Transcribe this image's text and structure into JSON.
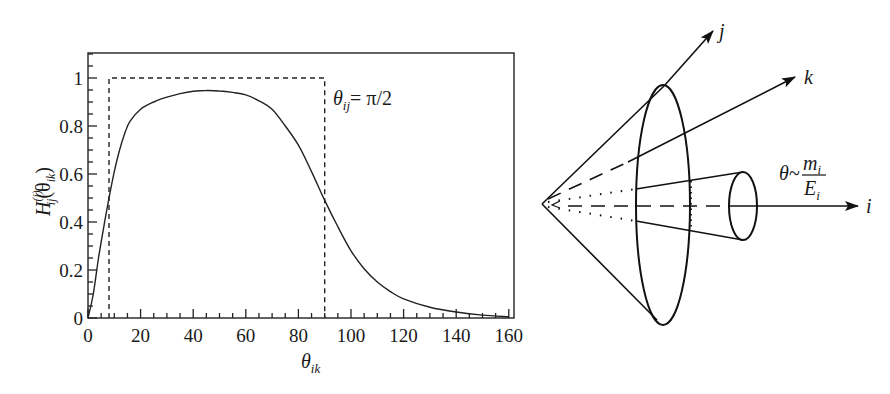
{
  "chart_data": {
    "type": "line",
    "title": "",
    "xlabel": "θ_ik",
    "ylabel": "H_ij^(i)(θ_ik)",
    "xlim": [
      0,
      160
    ],
    "ylim": [
      0,
      1.1
    ],
    "x_ticks": [
      0,
      20,
      40,
      60,
      80,
      100,
      120,
      140,
      160
    ],
    "y_ticks": [
      0,
      0.2,
      0.4,
      0.6,
      0.8,
      1
    ],
    "x_tick_labels": [
      "0",
      "20",
      "40",
      "60",
      "80",
      "100",
      "120",
      "140",
      "160"
    ],
    "y_tick_labels": [
      "0",
      "0.2",
      "0.4",
      "0.6",
      "0.8",
      "1"
    ],
    "grid": false,
    "legend": null,
    "annotation": "θ_ij = π/2",
    "series": [
      {
        "name": "H_ij^(i)(θ_ik)",
        "style": "solid",
        "x": [
          0,
          2,
          4,
          6,
          8,
          10,
          12,
          14,
          16,
          20,
          25,
          30,
          35,
          40,
          45,
          50,
          55,
          60,
          65,
          70,
          75,
          80,
          85,
          90,
          95,
          100,
          105,
          110,
          115,
          120,
          130,
          140,
          150,
          160
        ],
        "y": [
          0,
          0.1,
          0.25,
          0.38,
          0.5,
          0.61,
          0.7,
          0.77,
          0.82,
          0.87,
          0.9,
          0.92,
          0.935,
          0.945,
          0.948,
          0.946,
          0.94,
          0.93,
          0.905,
          0.87,
          0.8,
          0.72,
          0.61,
          0.49,
          0.38,
          0.28,
          0.205,
          0.15,
          0.11,
          0.08,
          0.045,
          0.025,
          0.012,
          0.005
        ]
      },
      {
        "name": "step (θ_ij = π/2)",
        "style": "dashed",
        "x": [
          8,
          8,
          90,
          90
        ],
        "y": [
          0,
          1,
          1,
          0
        ]
      }
    ]
  },
  "plot": {
    "annotation_theta": "θ",
    "annotation_sub": "ij",
    "annotation_eq": "= π/2",
    "xlabel_theta": "θ",
    "xlabel_sub": "ik",
    "ylabel_H": "H",
    "ylabel_sup": "(i)",
    "ylabel_sub": "ij",
    "ylabel_arg_open": "(θ",
    "ylabel_arg_sub": "ik",
    "ylabel_arg_close": ")"
  },
  "diagram": {
    "axis_j_label": "j",
    "axis_k_label": "k",
    "axis_i_label": "i",
    "cone_angle_theta": "θ~",
    "cone_angle_num": "m",
    "cone_angle_num_sub": "i",
    "cone_angle_den": "E",
    "cone_angle_den_sub": "i"
  }
}
